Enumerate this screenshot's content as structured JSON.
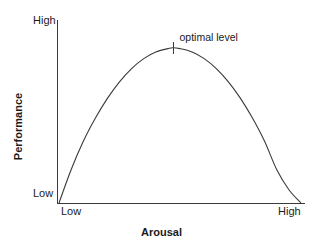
{
  "chart_data": {
    "type": "line",
    "title": "",
    "subtitle": "",
    "xlabel": "Arousal",
    "ylabel": "Performance",
    "x_tick_labels": [
      "Low",
      "High"
    ],
    "y_tick_labels": [
      "Low",
      "High"
    ],
    "xlim": [
      0,
      1
    ],
    "ylim": [
      0,
      1
    ],
    "grid": false,
    "legend": false,
    "legend_position": "none",
    "curve_name": "inverted-u-performance-curve",
    "x": [
      0.0,
      0.05,
      0.1,
      0.15,
      0.2,
      0.25,
      0.3,
      0.35,
      0.4,
      0.45,
      0.47,
      0.5,
      0.55,
      0.6,
      0.65,
      0.7,
      0.75,
      0.8,
      0.85,
      0.9,
      0.95,
      1.0
    ],
    "y": [
      0.0,
      0.2,
      0.37,
      0.51,
      0.63,
      0.73,
      0.81,
      0.87,
      0.91,
      0.93,
      0.935,
      0.93,
      0.91,
      0.87,
      0.81,
      0.73,
      0.63,
      0.51,
      0.37,
      0.2,
      0.08,
      0.0
    ],
    "annotations": [
      {
        "name": "optimal-level",
        "text": "optimal level",
        "x": 0.47,
        "y": 0.935,
        "marker": "vertical-tick"
      }
    ]
  },
  "axes": {
    "y_title": "Performance",
    "x_title": "Arousal",
    "y_high": "High",
    "y_low": "Low",
    "x_low": "Low",
    "x_high": "High"
  },
  "annotation": {
    "optimal_label": "optimal level"
  },
  "colors": {
    "line": "#3a3a3a",
    "axis": "#3a3a3a",
    "text": "#1a1a1a",
    "background": "#ffffff"
  }
}
